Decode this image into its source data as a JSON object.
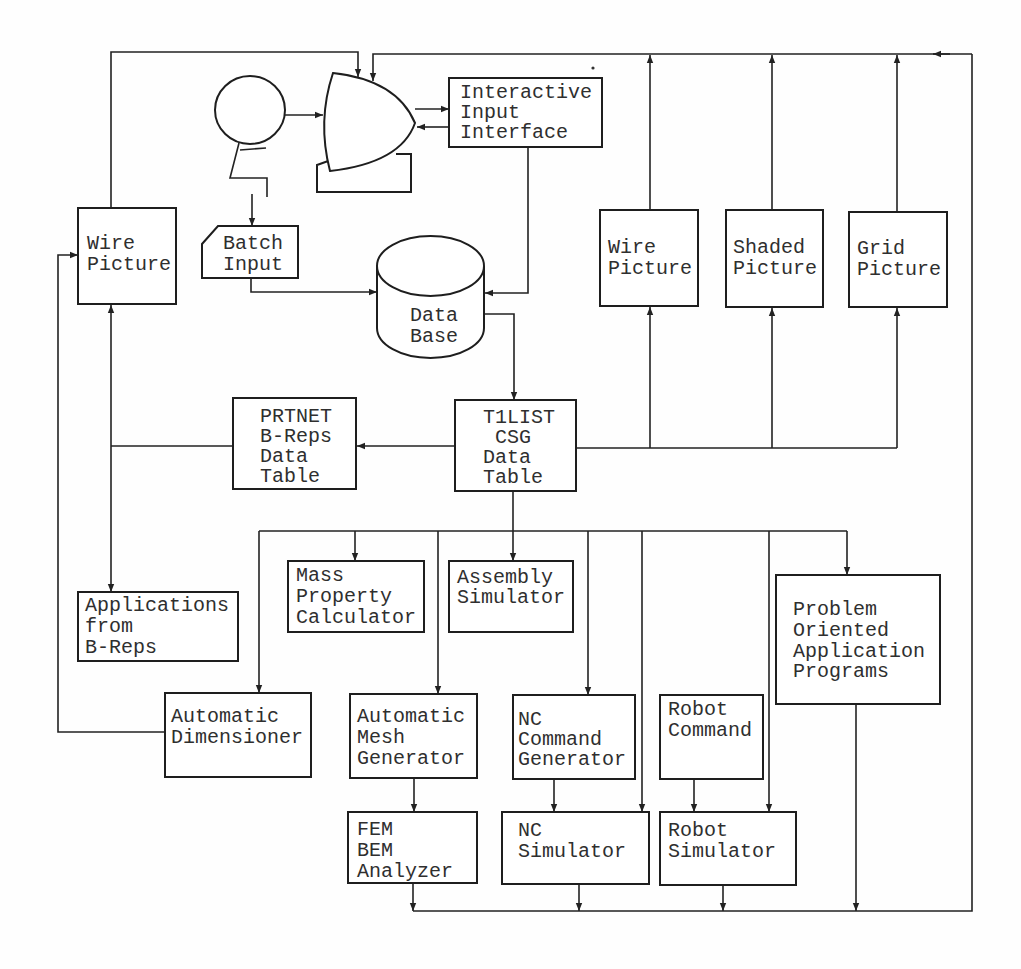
{
  "diagram": {
    "nodes": {
      "interactive_input_interface": {
        "lines": [
          "Interactive",
          "Input",
          "Interface"
        ]
      },
      "batch_input": {
        "lines": [
          "Batch",
          "Input"
        ]
      },
      "data_base": {
        "lines": [
          "Data",
          "Base"
        ]
      },
      "wire_picture_left": {
        "lines": [
          "Wire",
          "Picture"
        ]
      },
      "wire_picture_right": {
        "lines": [
          "Wire",
          "Picture"
        ]
      },
      "shaded_picture": {
        "lines": [
          "Shaded",
          "Picture"
        ]
      },
      "grid_picture": {
        "lines": [
          "Grid",
          "Picture"
        ]
      },
      "prtnet": {
        "lines": [
          "PRTNET",
          "B-Reps",
          "Data",
          "Table"
        ]
      },
      "t1list": {
        "lines": [
          "T1LIST",
          "CSG",
          "Data",
          "Table"
        ]
      },
      "mass_property": {
        "lines": [
          "Mass",
          "Property",
          "Calculator"
        ]
      },
      "assembly_simulator": {
        "lines": [
          "Assembly",
          "Simulator"
        ]
      },
      "applications_breps": {
        "lines": [
          "Applications",
          "from",
          "B-Reps"
        ]
      },
      "problem_oriented": {
        "lines": [
          "Problem",
          "Oriented",
          "Application",
          "Programs"
        ]
      },
      "automatic_dimensioner": {
        "lines": [
          "Automatic",
          "Dimensioner"
        ]
      },
      "automatic_mesh": {
        "lines": [
          "Automatic",
          "Mesh",
          "Generator"
        ]
      },
      "nc_command": {
        "lines": [
          "NC",
          "Command",
          "Generator"
        ]
      },
      "robot_command": {
        "lines": [
          "Robot",
          "Command"
        ]
      },
      "fem_bem": {
        "lines": [
          "FEM",
          "BEM",
          "Analyzer"
        ]
      },
      "nc_simulator": {
        "lines": [
          "NC",
          "Simulator"
        ]
      },
      "robot_simulator": {
        "lines": [
          "Robot",
          "Simulator"
        ]
      }
    },
    "icons": {
      "operator": "user-operator-icon",
      "display": "crt-display-terminal-icon",
      "database": "database-cylinder-icon",
      "batch": "punched-card-icon"
    },
    "colors": {
      "ink": "#222222",
      "paper": "#ffffff"
    }
  }
}
